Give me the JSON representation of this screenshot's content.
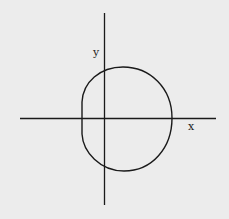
{
  "diagram": {
    "background": "#ececec",
    "stroke": "#1a1a1a",
    "axes": {
      "x_label": "x",
      "y_label": "y"
    },
    "curve": {
      "description": "closed loop, roughly circular, flattened on the left side, straddling the origin",
      "center_approx": [
        124,
        119
      ],
      "top": [
        123,
        67
      ],
      "bottom": [
        124,
        171
      ],
      "right": [
        172,
        118
      ],
      "left": [
        82,
        118
      ]
    }
  }
}
